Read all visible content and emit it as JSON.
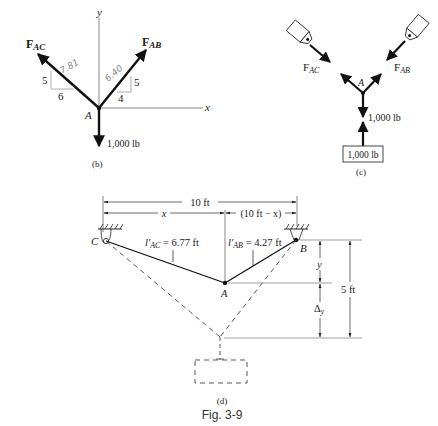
{
  "figure": {
    "caption": "Fig. 3-9"
  },
  "panel_b": {
    "label": "(b)",
    "axis_x": "x",
    "axis_y": "y",
    "point": "A",
    "force_ac": {
      "main": "F",
      "sub": "AC"
    },
    "force_ab": {
      "main": "F",
      "sub": "AB"
    },
    "load": "1,000 lb",
    "triangle_ac": {
      "rise": "5",
      "run": "6",
      "hyp_note": "7.81"
    },
    "triangle_ab": {
      "rise": "5",
      "run": "4",
      "hyp_note": "6.40"
    }
  },
  "panel_c": {
    "label": "(c)",
    "point": "A",
    "force_ac": {
      "main": "F",
      "sub": "AC"
    },
    "force_ab": {
      "main": "F",
      "sub": "AB"
    },
    "load": "1,000 lb",
    "weight_box": "1,000 lb"
  },
  "panel_d": {
    "label": "(d)",
    "span": "10 ft",
    "x_dim": "x",
    "remainder_dim": "(10 ft − x)",
    "support_c": "C",
    "support_b": "B",
    "point": "A",
    "len_ac": {
      "sym": "l′",
      "sub": "AC",
      "val": " = 6.77 ft"
    },
    "len_ab": {
      "sym": "l′",
      "sub": "AB",
      "val": " = 4.27 ft"
    },
    "y_dim": "y",
    "delta_dim": {
      "main": "Δ",
      "sub": "y"
    },
    "height_dim": "5 ft"
  }
}
